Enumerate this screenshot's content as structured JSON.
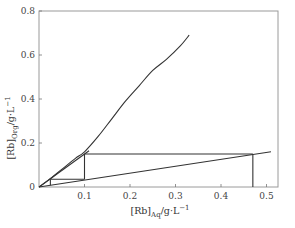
{
  "chart_data": {
    "type": "line",
    "title": "",
    "xlabel": "[Rb]Aq/g·L⁻¹",
    "ylabel": "[Rb]Org/g·L⁻¹",
    "xlabel_parts": {
      "main": "[Rb]",
      "sub": "Aq",
      "unit": "/g·L",
      "sup": "−1"
    },
    "ylabel_parts": {
      "main": "[Rb]",
      "sub": "Org",
      "unit": "/g·L",
      "sup": "−1"
    },
    "xlim": [
      0,
      0.55
    ],
    "ylim": [
      0,
      0.8
    ],
    "x_ticks": [
      "0.1",
      "0.2",
      "0.3",
      "0.4",
      "0.5"
    ],
    "y_ticks": [
      "0",
      "0.2",
      "0.4",
      "0.6",
      "0.8"
    ],
    "origin_label": "0",
    "grid": false,
    "legend": null,
    "series": [
      {
        "name": "Extraction isotherm",
        "x": [
          0.0,
          0.02,
          0.05,
          0.08,
          0.1,
          0.13,
          0.16,
          0.19,
          0.22,
          0.25,
          0.28,
          0.31,
          0.33
        ],
        "y": [
          0.0,
          0.03,
          0.08,
          0.13,
          0.16,
          0.23,
          0.31,
          0.39,
          0.46,
          0.53,
          0.58,
          0.64,
          0.69
        ]
      },
      {
        "name": "Upper operating line",
        "x": [
          0.0,
          0.11
        ],
        "y": [
          0.0,
          0.165
        ]
      },
      {
        "name": "Lower operating line",
        "x": [
          0.0,
          0.51
        ],
        "y": [
          0.0,
          0.16
        ]
      },
      {
        "name": "McCabe-Thiele stages",
        "x": [
          0.47,
          0.47,
          0.1,
          0.1,
          0.1,
          0.025,
          0.025,
          0.025
        ],
        "y": [
          0.0,
          0.15,
          0.15,
          0.035,
          0.035,
          0.035,
          0.04,
          0.0
        ],
        "segments": [
          {
            "x": [
              0.47,
              0.47
            ],
            "y": [
              0.0,
              0.15
            ]
          },
          {
            "x": [
              0.47,
              0.1
            ],
            "y": [
              0.15,
              0.15
            ]
          },
          {
            "x": [
              0.1,
              0.1
            ],
            "y": [
              0.15,
              0.035
            ]
          },
          {
            "x": [
              0.1,
              0.025
            ],
            "y": [
              0.035,
              0.035
            ]
          },
          {
            "x": [
              0.025,
              0.025
            ],
            "y": [
              0.035,
              0.008
            ]
          }
        ]
      }
    ]
  }
}
